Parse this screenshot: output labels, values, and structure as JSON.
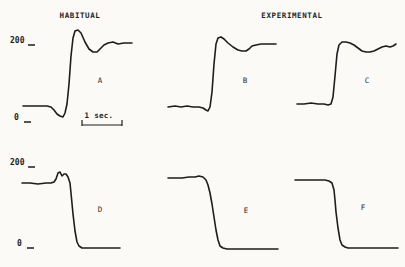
{
  "figure": {
    "columns": [
      {
        "title": "HABITUAL"
      },
      {
        "title": "EXPERIMENTAL"
      }
    ],
    "rows": [
      {
        "top_label": "200",
        "bottom_label": "0"
      },
      {
        "top_label": "200",
        "bottom_label": "0"
      }
    ],
    "scale_bar": {
      "label": "1 sec."
    }
  },
  "chart_data": {
    "type": "line",
    "title": "",
    "groups": [
      "HABITUAL",
      "EXPERIMENTAL"
    ],
    "y_axis": {
      "ticks": [
        0,
        200
      ],
      "tick_labels": [
        "0",
        "200"
      ]
    },
    "x_axis": {
      "scale_bar_seconds": 1,
      "scale_bar_px": 40
    },
    "calibration": {
      "row1": {
        "y_at_200_px": 44,
        "y_at_0_px": 121
      },
      "row2": {
        "y_at_200_px": 167,
        "y_at_0_px": 248
      }
    },
    "panels": [
      {
        "label": "A",
        "group": "HABITUAL",
        "row": 1,
        "shape": "baseline, small dip, steep rise with overshoot, settles near 200",
        "levels": {
          "start": 39,
          "dip": 10,
          "peak": 236,
          "end": 203
        },
        "points_px": [
          [
            23,
            106
          ],
          [
            32,
            106
          ],
          [
            40,
            106
          ],
          [
            47,
            106
          ],
          [
            51,
            107
          ],
          [
            54,
            110
          ],
          [
            57,
            114
          ],
          [
            60,
            116
          ],
          [
            63,
            117
          ],
          [
            65,
            113
          ],
          [
            67,
            104
          ],
          [
            69,
            84
          ],
          [
            71,
            56
          ],
          [
            73,
            38
          ],
          [
            75,
            31
          ],
          [
            78,
            30
          ],
          [
            81,
            33
          ],
          [
            85,
            42
          ],
          [
            89,
            49
          ],
          [
            93,
            52
          ],
          [
            97,
            52
          ],
          [
            100,
            49
          ],
          [
            104,
            45
          ],
          [
            108,
            43
          ],
          [
            113,
            42
          ],
          [
            118,
            44
          ],
          [
            124,
            43
          ],
          [
            132,
            43
          ]
        ]
      },
      {
        "label": "B",
        "group": "EXPERIMENTAL",
        "row": 1,
        "shape": "baseline, slight dip, steep rise with small overshoot, settles near 200",
        "levels": {
          "start": 36,
          "dip": 26,
          "peak": 218,
          "end": 200
        },
        "points_px": [
          [
            168,
            107
          ],
          [
            175,
            106
          ],
          [
            181,
            107
          ],
          [
            187,
            106
          ],
          [
            193,
            107
          ],
          [
            199,
            107
          ],
          [
            203,
            108
          ],
          [
            206,
            110
          ],
          [
            208,
            111
          ],
          [
            210,
            107
          ],
          [
            212,
            92
          ],
          [
            214,
            64
          ],
          [
            216,
            44
          ],
          [
            218,
            38
          ],
          [
            221,
            37
          ],
          [
            224,
            39
          ],
          [
            228,
            43
          ],
          [
            233,
            47
          ],
          [
            238,
            50
          ],
          [
            242,
            51
          ],
          [
            246,
            51
          ],
          [
            249,
            49
          ],
          [
            252,
            46
          ],
          [
            256,
            45
          ],
          [
            261,
            44
          ],
          [
            266,
            44
          ],
          [
            271,
            44
          ],
          [
            276,
            44
          ]
        ]
      },
      {
        "label": "C",
        "group": "EXPERIMENTAL",
        "row": 1,
        "shape": "baseline, steep rise, slight sag then settles near 200",
        "levels": {
          "start": 44,
          "peak": 205,
          "sag": 179,
          "end": 200
        },
        "points_px": [
          [
            297,
            104
          ],
          [
            304,
            104
          ],
          [
            311,
            103
          ],
          [
            318,
            104
          ],
          [
            324,
            104
          ],
          [
            328,
            105
          ],
          [
            331,
            104
          ],
          [
            333,
            97
          ],
          [
            335,
            76
          ],
          [
            337,
            54
          ],
          [
            339,
            45
          ],
          [
            342,
            42
          ],
          [
            346,
            42
          ],
          [
            350,
            43
          ],
          [
            354,
            45
          ],
          [
            358,
            48
          ],
          [
            362,
            51
          ],
          [
            366,
            52
          ],
          [
            370,
            52
          ],
          [
            374,
            51
          ],
          [
            378,
            49
          ],
          [
            382,
            47
          ],
          [
            386,
            46
          ],
          [
            390,
            47
          ],
          [
            393,
            46
          ],
          [
            396,
            44
          ]
        ]
      },
      {
        "label": "D",
        "group": "HABITUAL",
        "row": 2,
        "shape": "high plateau, double bump, steep fall to 0 baseline",
        "levels": {
          "start": 160,
          "bump": 188,
          "end": 0
        },
        "points_px": [
          [
            22,
            183
          ],
          [
            30,
            183
          ],
          [
            38,
            184
          ],
          [
            46,
            183
          ],
          [
            51,
            183
          ],
          [
            54,
            182
          ],
          [
            56,
            179
          ],
          [
            58,
            173
          ],
          [
            60,
            172
          ],
          [
            62,
            176
          ],
          [
            64,
            174
          ],
          [
            66,
            174
          ],
          [
            68,
            177
          ],
          [
            70,
            183
          ],
          [
            71,
            193
          ],
          [
            73,
            214
          ],
          [
            75,
            231
          ],
          [
            77,
            242
          ],
          [
            79,
            246
          ],
          [
            82,
            248
          ],
          [
            88,
            248
          ],
          [
            95,
            248
          ],
          [
            103,
            248
          ],
          [
            111,
            248
          ],
          [
            120,
            248
          ]
        ]
      },
      {
        "label": "E",
        "group": "EXPERIMENTAL",
        "row": 2,
        "shape": "high plateau, smooth steep fall to 0 baseline",
        "levels": {
          "start": 173,
          "end": 0
        },
        "points_px": [
          [
            168,
            178
          ],
          [
            175,
            178
          ],
          [
            182,
            178
          ],
          [
            189,
            177
          ],
          [
            195,
            177
          ],
          [
            199,
            176
          ],
          [
            203,
            177
          ],
          [
            206,
            180
          ],
          [
            208,
            185
          ],
          [
            210,
            193
          ],
          [
            212,
            204
          ],
          [
            214,
            217
          ],
          [
            216,
            230
          ],
          [
            218,
            240
          ],
          [
            220,
            246
          ],
          [
            223,
            248
          ],
          [
            227,
            249
          ],
          [
            234,
            249
          ],
          [
            242,
            249
          ],
          [
            252,
            249
          ],
          [
            262,
            249
          ],
          [
            270,
            249
          ],
          [
            278,
            249
          ]
        ]
      },
      {
        "label": "F",
        "group": "EXPERIMENTAL",
        "row": 2,
        "shape": "high plateau, near-vertical fall to 0 baseline",
        "levels": {
          "start": 168,
          "end": 0
        },
        "points_px": [
          [
            295,
            180
          ],
          [
            303,
            180
          ],
          [
            311,
            180
          ],
          [
            319,
            180
          ],
          [
            325,
            180
          ],
          [
            329,
            181
          ],
          [
            332,
            183
          ],
          [
            334,
            190
          ],
          [
            335,
            200
          ],
          [
            336,
            212
          ],
          [
            338,
            228
          ],
          [
            340,
            240
          ],
          [
            342,
            245
          ],
          [
            345,
            247
          ],
          [
            348,
            248
          ],
          [
            355,
            248
          ],
          [
            364,
            248
          ],
          [
            373,
            248
          ],
          [
            382,
            248
          ],
          [
            391,
            248
          ],
          [
            398,
            248
          ]
        ]
      }
    ],
    "axis_marks_px": [
      {
        "x1": 28,
        "y1": 45,
        "x2": 35,
        "y2": 45
      },
      {
        "x1": 24,
        "y1": 122,
        "x2": 31,
        "y2": 122
      },
      {
        "x1": 28,
        "y1": 167,
        "x2": 35,
        "y2": 167
      },
      {
        "x1": 27,
        "y1": 248,
        "x2": 34,
        "y2": 248
      }
    ],
    "scale_bar_px": {
      "x1": 82,
      "x2": 122,
      "y": 125,
      "tick_height": 5
    },
    "legend": "none",
    "grid": false
  }
}
